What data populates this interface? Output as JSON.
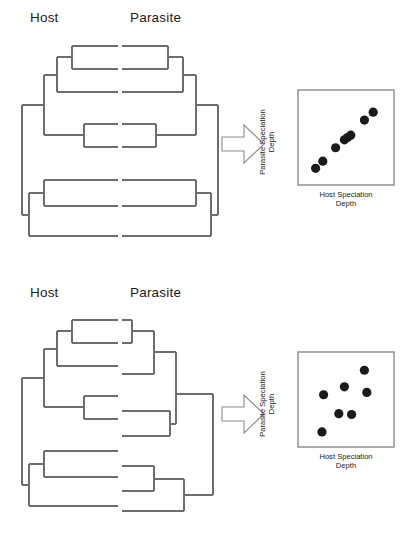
{
  "figure": {
    "background": "#ffffff",
    "line_color": "#6e6e6e",
    "dot_color": "#1a1a1a",
    "axis_color": "#8a8a8a"
  },
  "panels": [
    {
      "id": "congruent",
      "host_header": "Host",
      "parasite_header": "Parasite",
      "arrow_icon": "right-block-arrow-icon",
      "plot": {
        "ylabel_line1": "Parasite Speciation",
        "ylabel_line2": "Depth",
        "xlabel_line1": "Host Speciation",
        "xlabel_line2": "Depth"
      }
    },
    {
      "id": "incongruent",
      "host_header": "Host",
      "parasite_header": "Parasite",
      "arrow_icon": "right-block-arrow-icon",
      "plot": {
        "ylabel_line1": "Parasite Speciation",
        "ylabel_line2": "Depth",
        "xlabel_line1": "Host Speciation",
        "xlabel_line2": "Depth"
      }
    }
  ],
  "chart_data": [
    {
      "type": "scatter",
      "title": "Congruent host-parasite speciation depths",
      "xlabel": "Host Speciation Depth",
      "ylabel": "Parasite Speciation Depth",
      "xlim": [
        0,
        100
      ],
      "ylim": [
        0,
        100
      ],
      "grid": false,
      "legend": "none",
      "n_points": 8,
      "x": [
        12,
        21,
        37,
        48,
        52,
        56,
        73,
        84
      ],
      "y": [
        11,
        20,
        37,
        47,
        50,
        53,
        72,
        82
      ],
      "annotation": "Points fall close to a 1:1 line, indicating cospeciation"
    },
    {
      "type": "scatter",
      "title": "Incongruent host-parasite speciation depths",
      "xlabel": "Host Speciation Depth",
      "ylabel": "Parasite Speciation Depth",
      "xlim": [
        0,
        100
      ],
      "ylim": [
        0,
        100
      ],
      "grid": false,
      "legend": "none",
      "n_points": 7,
      "x": [
        20,
        22,
        41,
        48,
        57,
        73,
        76
      ],
      "y": [
        9,
        56,
        32,
        66,
        31,
        87,
        59
      ],
      "annotation": "Points are scattered with no relationship, indicating no cospeciation"
    }
  ],
  "trees": {
    "host_congruent": {
      "label": "host-phylogeny-congruent",
      "tip_count": 8,
      "orientation": "tips-right"
    },
    "parasite_congruent": {
      "label": "parasite-phylogeny-congruent",
      "tip_count": 8,
      "orientation": "tips-left",
      "note": "mirror image of host tree - fully congruent"
    },
    "host_incongruent": {
      "label": "host-phylogeny-incongruent",
      "tip_count": 8,
      "orientation": "tips-right"
    },
    "parasite_incongruent": {
      "label": "parasite-phylogeny-incongruent",
      "tip_count": 8,
      "orientation": "tips-left",
      "note": "different branch lengths and topology - incongruent"
    }
  }
}
